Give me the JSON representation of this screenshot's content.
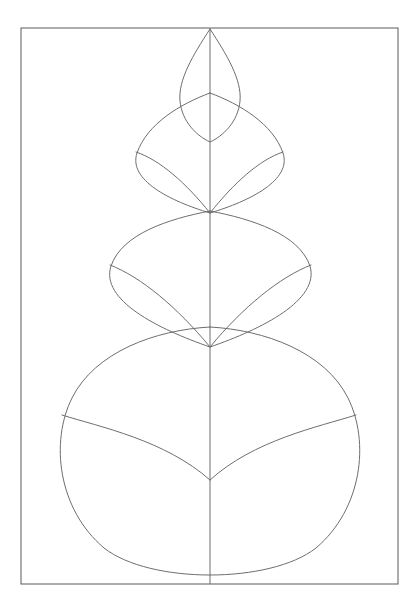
{
  "artwork": {
    "title": "Stacked Leaf Outline Drawing",
    "medium": "line art",
    "background_color": "#ffffff",
    "stroke_color": "#6e6e6e",
    "frame_stroke_color": "#5a5a5a",
    "canvas": {
      "width": 420,
      "height": 615
    }
  },
  "frame": {
    "name": "page-border",
    "x": 21,
    "y": 28,
    "width": 377,
    "height": 556,
    "stroke_width": 1
  },
  "midrib": {
    "name": "central-midrib",
    "x": 210,
    "y_top": 29,
    "y_bottom": 584,
    "stroke_width": 1,
    "path": "M 210 29 L 210 584"
  },
  "tiers": [
    {
      "id": "tier-1",
      "label": "Leaf tip lens",
      "left_x": 178,
      "right_x": 243,
      "top_y": 29,
      "bottom_y": 142,
      "apex_y": 29,
      "vee_y": 142,
      "outline_path": "M 210 29 C 193 55 178 80 180 101 C 182 122 197 136 210 142 C 223 136 238 122 240 101 C 242 80 227 55 210 29 Z",
      "veins": []
    },
    {
      "id": "tier-2",
      "label": "Second leaf tier",
      "left_x": 136,
      "right_x": 283,
      "top_y": 93,
      "bottom_y": 213,
      "shoulder_y": 152,
      "vee_y": 213,
      "outline_path": "M 210 93 C 180 104 147 124 137 153 C 128 180 170 201 210 213 C 250 201 292 180 283 153 C 273 124 240 104 210 93 Z",
      "veins": [
        "M 136 152 C 160 160 186 183 210 213",
        "M 283 152 C 259 160 234 183 210 213"
      ]
    },
    {
      "id": "tier-3",
      "label": "Third leaf tier",
      "left_x": 110,
      "right_x": 311,
      "top_y": 211,
      "bottom_y": 347,
      "shoulder_y": 265,
      "vee_y": 347,
      "outline_path": "M 210 211 C 168 219 122 234 111 266 C 100 300 158 329 210 347 C 262 329 320 300 310 266 C 299 234 252 219 210 211 Z",
      "veins": [
        "M 110 265 C 141 277 177 307 210 347",
        "M 311 265 C 280 277 243 307 210 347"
      ]
    },
    {
      "id": "tier-4",
      "label": "Bottom leaf tier",
      "left_x": 62,
      "right_x": 356,
      "top_y": 327,
      "bottom_y": 584,
      "shoulder_y": 415,
      "vee_y": 480,
      "outline_path": "M 210 327 C 155 330 95 352 72 398 C 50 442 58 509 104 548 C 150 584 270 584 316 548 C 362 509 370 442 348 398 C 325 352 265 330 210 327 Z",
      "veins": [
        "M 62 415 C 100 427 165 440 210 480",
        "M 356 415 C 318 427 254 440 210 480"
      ]
    }
  ],
  "summary": {
    "tier_count": 4,
    "total_vein_count": 6,
    "symmetry": "bilateral about vertical midrib"
  }
}
